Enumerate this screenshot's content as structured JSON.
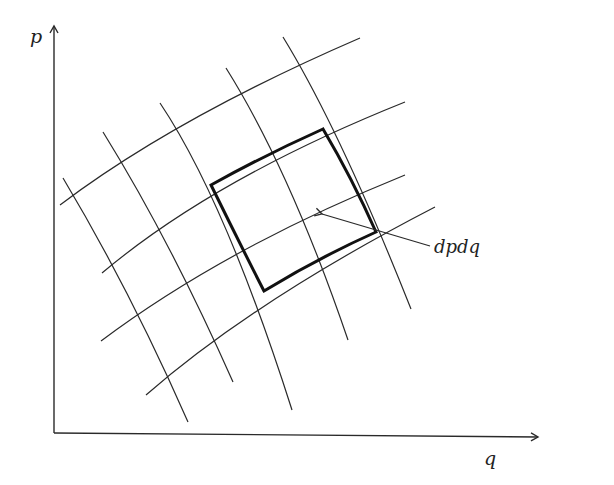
{
  "figure": {
    "axes": {
      "y_label": "p",
      "x_label": "q"
    },
    "annotation": {
      "label": "dpdq"
    },
    "grid": {
      "description": "curvilinear coordinate grid in phase space",
      "horizontal_curve_count": 5,
      "vertical_curve_count": 5
    },
    "highlighted_cell": {
      "description": "area element dp dq (bold quadrilateral spanning 2x2 grid cells)"
    },
    "colors": {
      "line": "#2a2a2a",
      "bold": "#111111",
      "background": "#ffffff"
    }
  }
}
